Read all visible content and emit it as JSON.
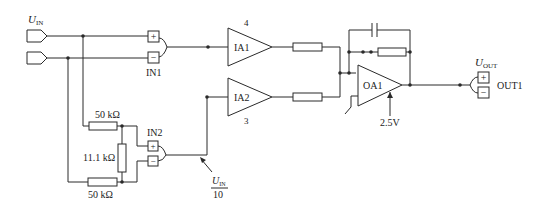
{
  "diagram": {
    "input_label_main": "U",
    "input_label_sub": "IN",
    "in1_label": "IN1",
    "in2_label": "IN2",
    "ia1_label": "IA1",
    "ia1_pin": "4",
    "ia2_label": "IA2",
    "ia2_pin": "3",
    "oa1_label": "OA1",
    "ref_voltage": "2.5V",
    "r_top": "50 kΩ",
    "r_mid": "11.1 kΩ",
    "r_bot": "50 kΩ",
    "div_num_main": "U",
    "div_num_sub": "IN",
    "div_den": "10",
    "output_label_main": "U",
    "output_label_sub": "OUT",
    "out1_label": "OUT1",
    "plus": "+",
    "minus": "−"
  }
}
